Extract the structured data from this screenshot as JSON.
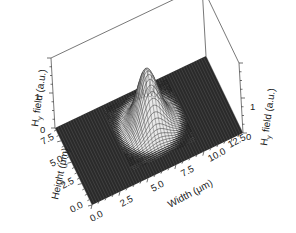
{
  "chart_data": {
    "type": "surface3d",
    "title": "",
    "xlabel": "Width (μm)",
    "ylabel": "Height (μm)",
    "zlabel_left": "Hy field (a.u.)",
    "zlabel_right": "Hy field (a.u.)",
    "x_ticks": [
      "0.0",
      "2.5",
      "5.0",
      "7.5",
      "10.0",
      "12.5"
    ],
    "y_ticks": [
      "0.0",
      "2.5",
      "5.0",
      "7.5"
    ],
    "z_ticks_left": [
      "0",
      "1"
    ],
    "z_ticks_right": [
      "0",
      "1"
    ],
    "xlim": [
      0,
      13.5
    ],
    "ylim": [
      0,
      9
    ],
    "zlim": [
      0,
      2
    ],
    "surface": {
      "shape": "gaussian",
      "peak_x": 7.0,
      "peak_y": 5.0,
      "peak_z": 1.6,
      "sigma_x": 0.9,
      "sigma_y": 1.1,
      "baseline": 0
    },
    "grid": false
  },
  "labels": {
    "xlabel": "Width (μm)",
    "ylabel": "Height (μm)",
    "zlabel_main": "H",
    "zlabel_sub": "y",
    "zlabel_rest": " field (a.u.)"
  },
  "colors": {
    "floor": "#2a2a2a",
    "mesh": "#111111",
    "surface_light": "#e8e8e8",
    "box": "#555555"
  }
}
